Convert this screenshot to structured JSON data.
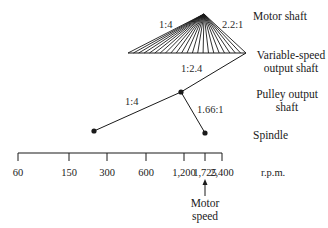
{
  "labels": {
    "motor_shaft": "Motor shaft",
    "variable_speed_line1": "Variable-speed",
    "variable_speed_line2": "output shaft",
    "pulley_line1": "Pulley output",
    "pulley_line2": "shaft",
    "spindle": "Spindle",
    "motor_speed_line1": "Motor",
    "motor_speed_line2": "speed"
  },
  "ratios": {
    "fan_left": "1:4",
    "fan_right": "2.2:1",
    "variable_to_pulley": "1:2.4",
    "pulley_left": "1:4",
    "pulley_right": "1.66:1"
  },
  "axis": {
    "unit": "r.p.m.",
    "ticks": [
      {
        "label": "60",
        "x": 18
      },
      {
        "label": "150",
        "x": 69
      },
      {
        "label": "300",
        "x": 107
      },
      {
        "label": "600",
        "x": 146
      },
      {
        "label": "1,200",
        "x": 184
      },
      {
        "label": "1,725",
        "x": 205
      },
      {
        "label": "2,400",
        "x": 222
      }
    ]
  },
  "colors": {
    "ink": "#1a1a1a",
    "background": "#ffffff"
  }
}
